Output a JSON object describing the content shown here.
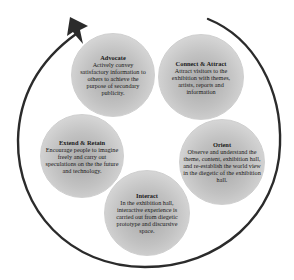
{
  "diagram": {
    "type": "cycle",
    "direction": "clockwise",
    "colors": {
      "arrow": "#2b2b2b",
      "circle_center": "#a9a9a9",
      "circle_edge": "#e4e4e4",
      "text": "#1a1a1a"
    },
    "stages": [
      {
        "id": "advocate",
        "title": "Advocate",
        "description": "Actively convey satisfactory information to others to achieve the purpose of secondary publicity."
      },
      {
        "id": "connect-attract",
        "title": "Connect & Attract",
        "description": "Attract visitors to the exhibition with themes, artists, reports and information"
      },
      {
        "id": "orient",
        "title": "Orient",
        "description": "Observe and understand the theme, content, exhibition hall, and re-establish the world view in the diegetic of the exhibition hall."
      },
      {
        "id": "interact",
        "title": "Interact",
        "description": "In the exhibition hall, interactive experience is carried out from diegetic prototype and discursive space."
      },
      {
        "id": "extend-retain",
        "title": "Extend & Retain",
        "description": "Encourage people to imagine freely and carry out speculations on the the future and technology."
      }
    ]
  }
}
